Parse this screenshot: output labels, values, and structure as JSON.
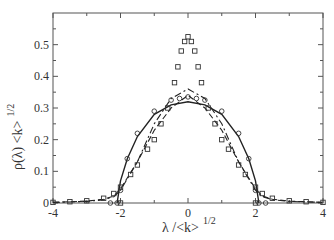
{
  "chart_data": {
    "type": "line",
    "title": "",
    "xlabel": "λ /<k>",
    "xlabel_sup": "1/2",
    "ylabel": "ρ(λ) <k>",
    "ylabel_sup": "1/2",
    "xlim": [
      -4,
      4
    ],
    "ylim": [
      0,
      0.6
    ],
    "xticks": [
      "-4",
      "-2",
      "0",
      "2",
      "4"
    ],
    "yticks": [
      "0",
      "0.1",
      "0.2",
      "0.3",
      "0.4",
      "0.5"
    ],
    "grid": false,
    "legend": null,
    "series": [
      {
        "name": "semicircle (solid)",
        "style": "solid",
        "x": [
          -2.1,
          -2.0,
          -1.8,
          -1.5,
          -1.0,
          -0.5,
          0,
          0.5,
          1.0,
          1.5,
          1.8,
          2.0,
          2.1
        ],
        "y": [
          0.0,
          0.07,
          0.14,
          0.21,
          0.28,
          0.31,
          0.32,
          0.31,
          0.28,
          0.21,
          0.14,
          0.07,
          0.0
        ]
      },
      {
        "name": "circles",
        "style": "circle-markers",
        "x": [
          -2.3,
          -2.1,
          -2.0,
          -1.8,
          -1.5,
          -1.0,
          -0.5,
          -0.25,
          0,
          0.25,
          0.5,
          1.0,
          1.5,
          1.8,
          2.0,
          2.1,
          2.3
        ],
        "y": [
          0.0,
          0.0,
          0.04,
          0.14,
          0.22,
          0.29,
          0.325,
          0.33,
          0.335,
          0.33,
          0.325,
          0.29,
          0.22,
          0.14,
          0.04,
          0.0,
          0.0
        ]
      },
      {
        "name": "dash-dot",
        "style": "dashdot",
        "x": [
          -4,
          -3,
          -2.5,
          -2.2,
          -2.0,
          -1.5,
          -1.0,
          -0.5,
          0,
          0.5,
          1.0,
          1.5,
          2.0,
          2.2,
          2.5,
          3,
          4
        ],
        "y": [
          0.002,
          0.005,
          0.01,
          0.02,
          0.04,
          0.13,
          0.25,
          0.33,
          0.36,
          0.33,
          0.25,
          0.13,
          0.04,
          0.02,
          0.01,
          0.005,
          0.002
        ]
      },
      {
        "name": "dashed",
        "style": "dashed",
        "x": [
          -4,
          -3,
          -2.5,
          -2.2,
          -2.0,
          -1.5,
          -1.0,
          -0.5,
          0,
          0.5,
          1.0,
          1.5,
          2.0,
          2.2,
          2.5,
          3,
          4
        ],
        "y": [
          0.002,
          0.006,
          0.012,
          0.022,
          0.045,
          0.13,
          0.23,
          0.3,
          0.34,
          0.3,
          0.23,
          0.13,
          0.045,
          0.022,
          0.012,
          0.006,
          0.002
        ]
      },
      {
        "name": "squares",
        "style": "square-markers",
        "x": [
          -4,
          -3.5,
          -3,
          -2.5,
          -2.2,
          -2.0,
          -2.0,
          -1.7,
          -1.5,
          -1.2,
          -1.0,
          -0.8,
          -0.6,
          -0.4,
          -0.3,
          -0.2,
          -0.1,
          0,
          0.1,
          0.2,
          0.3,
          0.4,
          0.6,
          0.8,
          1.0,
          1.2,
          1.5,
          1.7,
          2.0,
          2.0,
          2.2,
          2.5,
          3,
          3.5,
          4
        ],
        "y": [
          0.002,
          0.004,
          0.007,
          0.015,
          0.03,
          0.05,
          0.0,
          0.09,
          0.12,
          0.17,
          0.2,
          0.25,
          0.3,
          0.38,
          0.43,
          0.48,
          0.51,
          0.525,
          0.51,
          0.48,
          0.43,
          0.38,
          0.3,
          0.25,
          0.2,
          0.17,
          0.12,
          0.09,
          0.05,
          0.0,
          0.03,
          0.015,
          0.007,
          0.004,
          0.002
        ]
      }
    ]
  },
  "plot": {
    "ylabel_main": "ρ(λ) <k>",
    "ylabel_sup": "1/2",
    "xlabel_main": "λ /<k>",
    "xlabel_sup": "1/2"
  }
}
